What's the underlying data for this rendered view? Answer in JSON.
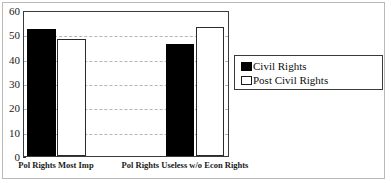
{
  "chart_data": {
    "type": "bar",
    "title": "",
    "subtitle": "",
    "xlabel": "",
    "ylabel": "",
    "categories": [
      "Pol Rights Most Imp",
      "Pol Rights Useless w/o Econ Rights"
    ],
    "series": [
      {
        "name": "Civil Rights",
        "values": [
          52,
          46
        ],
        "color": "#000000",
        "swatch": "filled"
      },
      {
        "name": "Post Civil Rights",
        "values": [
          48,
          53
        ],
        "color": "#ffffff",
        "swatch": "hollow"
      }
    ],
    "ylim": [
      0,
      60
    ],
    "yticks": [
      0,
      10,
      20,
      30,
      40,
      50,
      60
    ],
    "ytick_labels": [
      "0",
      "10",
      "20",
      "30",
      "40",
      "50",
      "60"
    ],
    "gridlines": [
      10,
      20,
      30,
      40,
      50
    ],
    "grid": true,
    "legend_position": "right",
    "legend_entries": [
      "Civil Rights",
      "Post Civil Rights"
    ],
    "frame": true
  }
}
